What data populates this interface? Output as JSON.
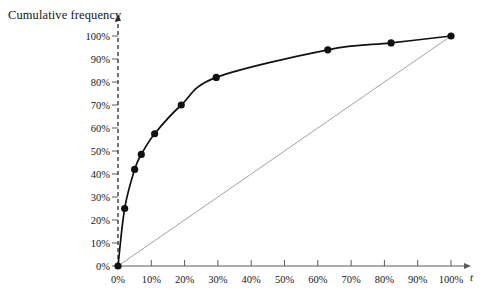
{
  "chart_data": {
    "type": "line",
    "title": "Cumulative frequency",
    "xlabel": "t",
    "ylabel": "Cumulative frequency",
    "xlim": [
      0,
      100
    ],
    "ylim": [
      0,
      100
    ],
    "grid": false,
    "legend": "none",
    "x_tick_labels": [
      "0%",
      "10%",
      "20%",
      "30%",
      "40%",
      "50%",
      "60%",
      "70%",
      "80%",
      "90%",
      "100%"
    ],
    "x_tick_values": [
      0,
      10,
      20,
      30,
      40,
      50,
      60,
      70,
      80,
      90,
      100
    ],
    "y_tick_labels": [
      "0%",
      "10%",
      "20%",
      "30%",
      "40%",
      "50%",
      "60%",
      "70%",
      "80%",
      "90%",
      "100%"
    ],
    "y_tick_values": [
      0,
      10,
      20,
      30,
      40,
      50,
      60,
      70,
      80,
      90,
      100
    ],
    "series": [
      {
        "name": "Lorenz curve",
        "marker": "filled-circle",
        "color": "#111111",
        "points": [
          {
            "x": 0,
            "y": 0
          },
          {
            "x": 2,
            "y": 25
          },
          {
            "x": 5,
            "y": 42
          },
          {
            "x": 7,
            "y": 48.5
          },
          {
            "x": 11,
            "y": 57.5
          },
          {
            "x": 19,
            "y": 70
          },
          {
            "x": 29.5,
            "y": 82
          },
          {
            "x": 63,
            "y": 94
          },
          {
            "x": 82,
            "y": 97
          },
          {
            "x": 100,
            "y": 100
          }
        ]
      },
      {
        "name": "line of equality",
        "marker": "none",
        "color": "#8a8a8a",
        "points": [
          {
            "x": 0,
            "y": 0
          },
          {
            "x": 100,
            "y": 100
          }
        ]
      }
    ]
  },
  "axes": {
    "y_axis_style": "dashed",
    "x_axis_style": "solid",
    "arrow_heads": [
      "y-top",
      "x-right"
    ]
  },
  "colors": {
    "curve": "#111111",
    "equality_line": "#8a8a8a",
    "axis": "#5a5a5a",
    "text": "#161616",
    "background": "#ffffff"
  }
}
